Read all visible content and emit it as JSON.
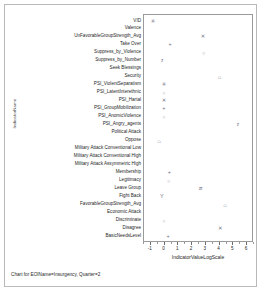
{
  "caption": "Chart for EOIName=Insurgency, Quarter=2",
  "axes": {
    "ylabel": "IndicatorName",
    "xlabel": "IndicatorValueLogScale",
    "xticks": [
      "-1",
      "0",
      "1",
      "2",
      "3",
      "4",
      "5",
      "6"
    ]
  },
  "chart_data": {
    "type": "scatter",
    "title": "",
    "subtitle": "Chart for EOIName=Insurgency, Quarter=2",
    "xlabel": "IndicatorValueLogScale",
    "ylabel": "IndicatorName",
    "xlim": [
      -1.5,
      6.5
    ],
    "grid": false,
    "legend": "none",
    "categories": [
      "VID",
      "Valence",
      "UnFavorableGroupStrength_Avg",
      "Take Over",
      "Suppress_by_Violence",
      "Suppress_by_Number",
      "Seek Blessings",
      "Security",
      "PSI_ViolentSeparatism",
      "PSI_LatentInterethnic",
      "PSI_Hartal",
      "PSI_GroupMobilization",
      "PSI_AnomicViolence",
      "PSI_Angry_agents",
      "Political Attack",
      "Oppose",
      "Military Attack Conventional Low",
      "Military Attack Conventional High",
      "Military Attack Assymmetric High",
      "Membership",
      "Legitimacy",
      "Leave Group",
      "Fight Back",
      "FavorableGroupStrength_Avg",
      "Economic Attack",
      "Discriminate",
      "Disagree",
      "BasicNeedsLevel"
    ],
    "points": [
      {
        "category": "VID",
        "x": -0.85,
        "marker": "*"
      },
      {
        "category": "UnFavorableGroupStrength_Avg",
        "x": 2.8,
        "marker": "x"
      },
      {
        "category": "Take Over",
        "x": 0.4,
        "marker": "+"
      },
      {
        "category": "Suppress_by_Violence",
        "x": 2.85,
        "marker": "o"
      },
      {
        "category": "Suppress_by_Number",
        "x": -0.2,
        "marker": "z"
      },
      {
        "category": "Security",
        "x": 4.0,
        "marker": "^"
      },
      {
        "category": "PSI_ViolentSeparatism",
        "x": -0.05,
        "marker": "*"
      },
      {
        "category": "PSI_LatentInterethnic",
        "x": -0.05,
        "marker": "o"
      },
      {
        "category": "PSI_Hartal",
        "x": -0.05,
        "marker": "x"
      },
      {
        "category": "PSI_GroupMobilization",
        "x": -0.05,
        "marker": "+"
      },
      {
        "category": "PSI_AnomicViolence",
        "x": -0.05,
        "marker": "o"
      },
      {
        "category": "PSI_Angry_agents",
        "x": 5.3,
        "marker": "z"
      },
      {
        "category": "Oppose",
        "x": -0.4,
        "marker": "^"
      },
      {
        "category": "Membership",
        "x": 0.35,
        "marker": "+"
      },
      {
        "category": "Legitimacy",
        "x": 0.3,
        "marker": "o"
      },
      {
        "category": "Leave Group",
        "x": 2.6,
        "marker": "zz"
      },
      {
        "category": "Fight Back",
        "x": -0.2,
        "marker": "y"
      },
      {
        "category": "FavorableGroupStrength_Avg",
        "x": 4.4,
        "marker": "^"
      },
      {
        "category": "Discriminate",
        "x": -0.05,
        "marker": "o"
      },
      {
        "category": "Disagree",
        "x": 4.05,
        "marker": "x"
      },
      {
        "category": "BasicNeedsLevel",
        "x": 0.25,
        "marker": "+"
      }
    ]
  }
}
